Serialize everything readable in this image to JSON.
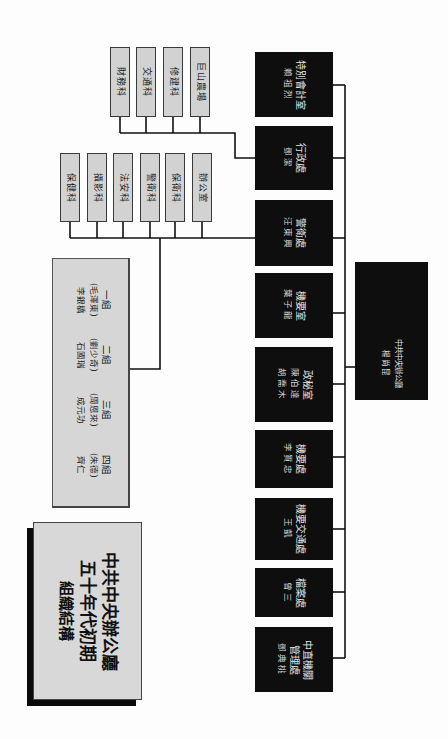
{
  "title": {
    "line1": "中共中央辦公廳",
    "line2": "五十年代初期",
    "line3": "組織結構"
  },
  "root": {
    "name": "中共中央辦公廳",
    "head": "楊尚昆"
  },
  "departments": [
    {
      "name": "特別會計室",
      "head": "賴祖烈"
    },
    {
      "name": "行政處",
      "head": "鄧潔"
    },
    {
      "name": "警衛處",
      "head": "汪東興"
    },
    {
      "name": "機要室",
      "head": "葉子龍"
    },
    {
      "name": "政秘室",
      "head": "陳伯達",
      "head2": "胡喬木"
    },
    {
      "name": "機要處",
      "head": "李質忠"
    },
    {
      "name": "機要交通處",
      "head": "王凱"
    },
    {
      "name": "檔案處",
      "head": "曾三"
    },
    {
      "name": "中直機關",
      "name2": "管理處",
      "head": "鄧典桃"
    }
  ],
  "administration_sections": {
    "parent": "行政處",
    "items": [
      "財務科",
      "交通科",
      "修建科",
      "巨山農場"
    ]
  },
  "security_sections": {
    "parent": "警衛處",
    "items": [
      "保健科",
      "攝影科",
      "法安科",
      "警衛科",
      "保衛科",
      "辦公室"
    ]
  },
  "guard_groups": {
    "parent": "警衛處",
    "groups": [
      {
        "label": "一組",
        "leader": "(毛澤東)",
        "member": "李銀橋"
      },
      {
        "label": "二組",
        "leader": "(劉少奇)",
        "member": "石國瑞"
      },
      {
        "label": "三組",
        "leader": "(周恩來)",
        "member": "成元功"
      },
      {
        "label": "四組",
        "leader": "(朱德)",
        "member": "齊仁"
      }
    ]
  },
  "colors": {
    "dept_box": "#0e0e0e",
    "section_box": "#d2d2d2",
    "connector": "#111111"
  }
}
